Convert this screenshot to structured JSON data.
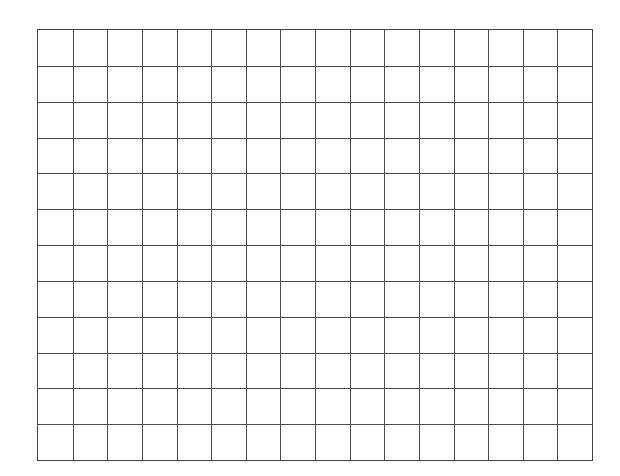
{
  "grid": {
    "columns": 16,
    "rows": 12,
    "line_color": "#4a4a4a",
    "border_color": "#444444",
    "background": "#ffffff"
  }
}
